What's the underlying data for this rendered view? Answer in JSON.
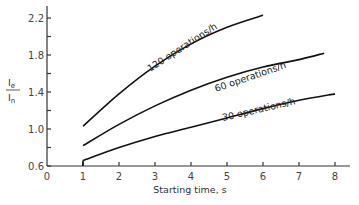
{
  "chart_data": {
    "type": "line",
    "title": "",
    "xlabel": "Starting time, s",
    "ylabel": "Ie/In",
    "ylabel_numerator": "I",
    "ylabel_numerator_sub": "e",
    "ylabel_denominator": "I",
    "ylabel_denominator_sub": "n",
    "xlim": [
      0,
      8
    ],
    "ylim": [
      0.6,
      2.3
    ],
    "x_ticks": [
      0,
      1,
      2,
      3,
      4,
      5,
      6,
      7,
      8
    ],
    "x_tick_labels": [
      "0",
      "1",
      "2",
      "3",
      "4",
      "5",
      "6",
      "7",
      "8"
    ],
    "y_ticks": [
      0.6,
      0.8,
      1.0,
      1.2,
      1.4,
      1.6,
      1.8,
      2.0,
      2.2
    ],
    "y_tick_labels": [
      "0.6",
      "",
      "1.0",
      "",
      "1.4",
      "",
      "1.8",
      "",
      "2.2"
    ],
    "grid": false,
    "legend": "inline labels on curves",
    "series": [
      {
        "name": "120 operations/h",
        "x": [
          1,
          2,
          3,
          4,
          5,
          6
        ],
        "y": [
          1.03,
          1.38,
          1.68,
          1.92,
          2.1,
          2.23
        ]
      },
      {
        "name": "60 operations/h",
        "x": [
          1,
          2,
          3,
          4,
          5,
          6,
          7,
          7.7
        ],
        "y": [
          0.82,
          1.05,
          1.25,
          1.42,
          1.56,
          1.67,
          1.75,
          1.82
        ]
      },
      {
        "name": "30 operations/h",
        "x": [
          1,
          2,
          3,
          4,
          5,
          6,
          7,
          8
        ],
        "y": [
          0.66,
          0.8,
          0.92,
          1.02,
          1.12,
          1.22,
          1.31,
          1.38
        ]
      }
    ]
  }
}
